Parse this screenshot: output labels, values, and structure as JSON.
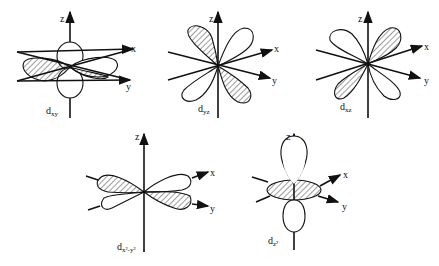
{
  "figure": {
    "axis_labels": {
      "x": "x",
      "y": "y",
      "z": "z"
    },
    "orbitals": [
      {
        "id": "dxy",
        "main": "d",
        "sub": "xy"
      },
      {
        "id": "dyz",
        "main": "d",
        "sub": "yz"
      },
      {
        "id": "dxz",
        "main": "d",
        "sub": "xz"
      },
      {
        "id": "dx2y2",
        "main": "d",
        "sub": "x²-y²"
      },
      {
        "id": "dz2",
        "main": "d",
        "sub": "z²"
      }
    ]
  }
}
